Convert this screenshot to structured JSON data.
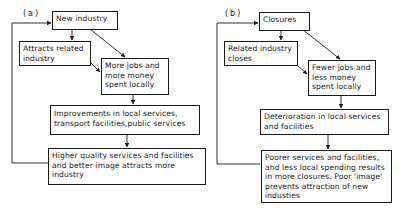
{
  "panels": [
    {
      "label": "(a)",
      "boxes": {
        "start": "New industry",
        "related": "Attracts related\nindustry",
        "jobs": "More jobs and\nmore money\nspent locally",
        "services": "Improvements in local services,\ntransport facilities,public services",
        "outcome": "Higher quality services and facilities\nand better image attracts more\nindustry"
      }
    },
    {
      "label": "(b)",
      "boxes": {
        "start": "Closures",
        "related": "Related industry\ncloses",
        "jobs": "Fewer jobs and\nless money\nspent locally",
        "services": "Deterioration in local services\nand facilities",
        "outcome": "Poorer services and facilities,\nand less local spending results\nin more closures. Poor 'image'\nprevents attraction of new\nindusties"
      }
    }
  ],
  "colors": {
    "ink": "#1a1a1a",
    "background": "#ffffff"
  }
}
